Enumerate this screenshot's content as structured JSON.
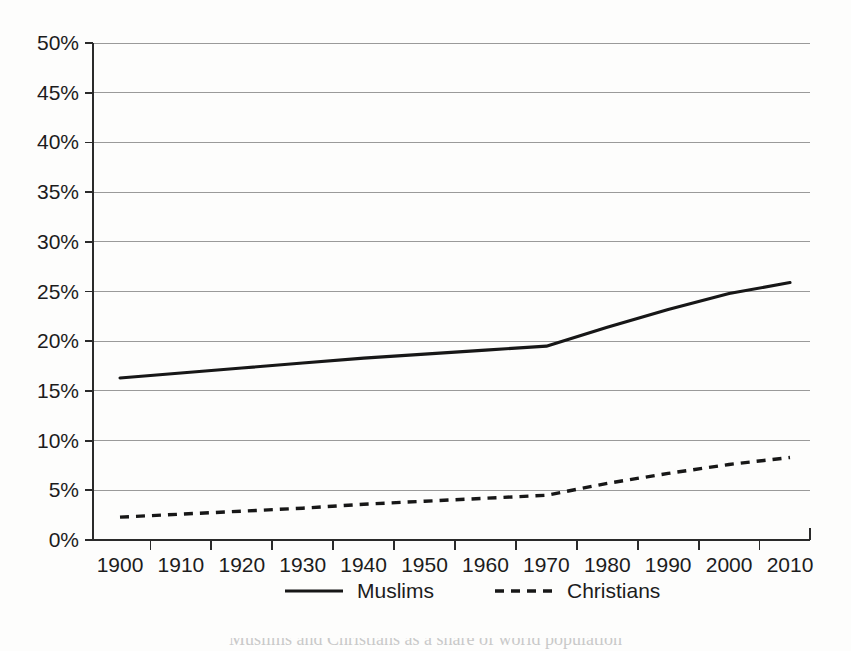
{
  "chart_data": {
    "type": "line",
    "title": "",
    "subtitle": "",
    "xlabel": "",
    "ylabel": "",
    "x": [
      1900,
      1910,
      1920,
      1930,
      1940,
      1950,
      1960,
      1970,
      1980,
      1990,
      2000,
      2010
    ],
    "xtick_labels": [
      "1900",
      "1910",
      "1920",
      "1930",
      "1940",
      "1950",
      "1960",
      "1970",
      "1980",
      "1990",
      "2000",
      "2010"
    ],
    "ytick_labels": [
      "0%",
      "5%",
      "10%",
      "15%",
      "20%",
      "25%",
      "30%",
      "35%",
      "40%",
      "45%",
      "50%"
    ],
    "ytick_values": [
      0,
      5,
      10,
      15,
      20,
      25,
      30,
      35,
      40,
      45,
      50
    ],
    "ylim": [
      0,
      50
    ],
    "xlim": [
      1900,
      2010
    ],
    "grid": "horizontal",
    "legend_position": "bottom",
    "series": [
      {
        "name": "Muslims",
        "style": "solid",
        "color": "#171717",
        "values": [
          16.3,
          16.8,
          17.3,
          17.8,
          18.3,
          18.7,
          19.1,
          19.5,
          21.4,
          23.2,
          24.8,
          25.9
        ]
      },
      {
        "name": "Christians",
        "style": "dashed",
        "color": "#171717",
        "values": [
          2.3,
          2.6,
          2.9,
          3.2,
          3.6,
          3.9,
          4.2,
          4.5,
          5.7,
          6.7,
          7.6,
          8.3
        ]
      }
    ]
  },
  "legend": {
    "items": [
      {
        "label": "Muslims",
        "style": "solid"
      },
      {
        "label": "Christians",
        "style": "dashed"
      }
    ]
  },
  "caption": {
    "text": "Muslims and Christians as a share of world population"
  },
  "colors": {
    "ink": "#171717",
    "grid": "#9a9a9a",
    "axis": "#2a2a2a",
    "paper": "#fdfdfc"
  }
}
